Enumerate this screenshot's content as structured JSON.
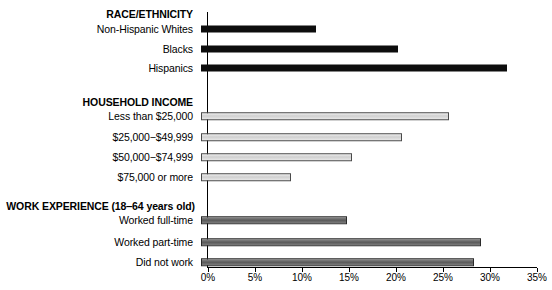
{
  "chart_data": {
    "type": "bar",
    "orientation": "horizontal",
    "title": "",
    "xlabel": "",
    "ylabel": "",
    "xlim": [
      0,
      35
    ],
    "xtick_labels": [
      "0%",
      "5%",
      "10%",
      "15%",
      "20%",
      "25%",
      "30%",
      "35%"
    ],
    "xtick_values": [
      0,
      5,
      10,
      15,
      20,
      25,
      30,
      35
    ],
    "grid": false,
    "legend": "none",
    "sections": [
      {
        "heading": "RACE/ETHNICITY",
        "style": "black",
        "categories": [
          "Non-Hispanic Whites",
          "Blacks",
          "Hispanics"
        ],
        "values": [
          12.1,
          20.8,
          32.4
        ]
      },
      {
        "heading": "HOUSEHOLD INCOME",
        "style": "light",
        "categories": [
          "Less than $25,000",
          "$25,000−$49,999",
          "$50,000−$74,999",
          "$75,000 or more"
        ],
        "values": [
          26.3,
          21.3,
          16.0,
          9.5
        ]
      },
      {
        "heading": "WORK EXPERIENCE (18‒64 years old)",
        "style": "dark",
        "categories": [
          "Worked full-time",
          "Worked part-time",
          "Did not work"
        ],
        "values": [
          15.4,
          29.7,
          28.9
        ]
      }
    ]
  },
  "sections": {
    "race": {
      "heading": "RACE/ETHNICITY",
      "rows": [
        {
          "label": "Non-Hispanic Whites",
          "value": 12.1
        },
        {
          "label": "Blacks",
          "value": 20.8
        },
        {
          "label": "Hispanics",
          "value": 32.4
        }
      ]
    },
    "income": {
      "heading": "HOUSEHOLD INCOME",
      "rows": [
        {
          "label": "Less than $25,000",
          "value": 26.3
        },
        {
          "label": "$25,000−$49,999",
          "value": 21.3
        },
        {
          "label": "$50,000−$74,999",
          "value": 16.0
        },
        {
          "label": "$75,000 or more",
          "value": 9.5
        }
      ]
    },
    "work": {
      "heading": "WORK EXPERIENCE (18‒64 years old)",
      "rows": [
        {
          "label": "Worked full-time",
          "value": 15.4
        },
        {
          "label": "Worked part-time",
          "value": 29.7
        },
        {
          "label": "Did not work",
          "value": 28.9
        }
      ]
    }
  },
  "axis": {
    "ticks": [
      {
        "label": "0%",
        "value": 0
      },
      {
        "label": "5%",
        "value": 5
      },
      {
        "label": "10%",
        "value": 10
      },
      {
        "label": "15%",
        "value": 15
      },
      {
        "label": "20%",
        "value": 20
      },
      {
        "label": "25%",
        "value": 25
      },
      {
        "label": "30%",
        "value": 30
      },
      {
        "label": "35%",
        "value": 35
      }
    ]
  },
  "colors": {
    "bar_black": "#0d0d0d",
    "bar_light": "#cfcfcf",
    "bar_dark": "#5a5a5a",
    "axis": "#000000",
    "background": "#ffffff"
  }
}
